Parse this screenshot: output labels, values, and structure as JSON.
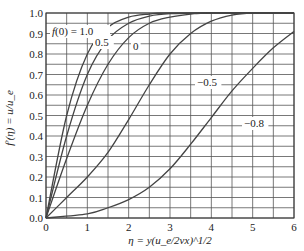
{
  "chart_data": {
    "type": "line",
    "title": "",
    "xlabel": "η = y(u_e/2νx)^1/2",
    "ylabel": "f′(η) = u/u_e",
    "xlim": [
      0,
      6
    ],
    "ylim": [
      0,
      1.0
    ],
    "xticks": [
      "0",
      "1",
      "2",
      "3",
      "4",
      "5",
      "6"
    ],
    "yticks": [
      "0.0",
      "0.1",
      "0.2",
      "0.3",
      "0.4",
      "0.5",
      "0.6",
      "0.7",
      "0.8",
      "0.9",
      "1.0"
    ],
    "grid": true,
    "legend_label_prefix": "f(0) = ",
    "series": [
      {
        "name": "1.0",
        "label": "f(0) = 1.0",
        "x": [
          0,
          0.5,
          1.0,
          1.5,
          2.0,
          2.5,
          3.0,
          6.0
        ],
        "y": [
          0,
          0.5,
          0.8,
          0.93,
          0.98,
          0.995,
          1.0,
          1.0
        ]
      },
      {
        "name": "0.5",
        "label": "0.5",
        "x": [
          0,
          0.5,
          1.0,
          1.5,
          2.0,
          2.5,
          3.0,
          4.0,
          6.0
        ],
        "y": [
          0,
          0.4,
          0.7,
          0.87,
          0.95,
          0.985,
          0.997,
          1.0,
          1.0
        ]
      },
      {
        "name": "0",
        "label": "0",
        "x": [
          0,
          0.5,
          1.0,
          1.5,
          2.0,
          2.5,
          3.0,
          3.5,
          4.0,
          6.0
        ],
        "y": [
          0,
          0.29,
          0.55,
          0.75,
          0.88,
          0.95,
          0.98,
          0.995,
          1.0,
          1.0
        ]
      },
      {
        "name": "-0.5",
        "label": "−0.5",
        "x": [
          0,
          0.5,
          1.0,
          1.5,
          2.0,
          2.5,
          3.0,
          3.5,
          4.0,
          4.5,
          5.0,
          6.0
        ],
        "y": [
          0,
          0.1,
          0.2,
          0.32,
          0.48,
          0.65,
          0.8,
          0.9,
          0.96,
          0.99,
          1.0,
          1.0
        ]
      },
      {
        "name": "-0.8",
        "label": "−0.8",
        "x": [
          0,
          1.0,
          1.5,
          2.0,
          2.5,
          3.0,
          3.5,
          4.0,
          4.5,
          5.0,
          5.5,
          6.0
        ],
        "y": [
          0,
          0.02,
          0.05,
          0.09,
          0.15,
          0.24,
          0.36,
          0.49,
          0.62,
          0.73,
          0.83,
          0.91
        ]
      }
    ]
  }
}
